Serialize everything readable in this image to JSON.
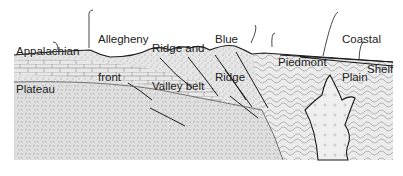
{
  "diagram": {
    "labels": [
      {
        "id": "appalachian-plateau",
        "line1": "Appalachian",
        "line2": "Plateau",
        "x": 16,
        "y": 20
      },
      {
        "id": "allegheny-front",
        "line1": "Allegheny",
        "line2": "front",
        "x": 98,
        "y": 8
      },
      {
        "id": "ridge-and-valley-belt",
        "line1": "Ridge and",
        "line2": "Valley belt",
        "x": 152,
        "y": 17
      },
      {
        "id": "blue-ridge",
        "line1": "Blue",
        "line2": "Ridge",
        "x": 215,
        "y": 8
      },
      {
        "id": "piedmont",
        "line1": "Piedmont",
        "line2": "",
        "x": 278,
        "y": 31
      },
      {
        "id": "coastal-plain",
        "line1": "Coastal",
        "line2": "Plain",
        "x": 342,
        "y": 8
      },
      {
        "id": "shelf",
        "line1": "Shelf",
        "line2": "",
        "x": 367,
        "y": 38
      }
    ],
    "colors": {
      "line": "#1a1a1a",
      "stipple_fill": "#e2e2e2",
      "basement_fill": "#dcdcdc",
      "piedmont_fill": "#ececec",
      "granite_fill": "#eeeeee",
      "brick_fill": "#e6e6e6"
    }
  }
}
